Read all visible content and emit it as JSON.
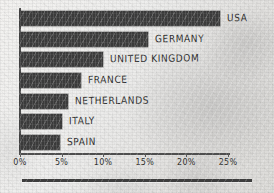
{
  "chart_data": {
    "type": "bar",
    "orientation": "horizontal",
    "title": "",
    "subtitle": "",
    "xlabel": "",
    "ylabel": "",
    "categories": [
      "USA",
      "GERMANY",
      "UNITED KINGDOM",
      "FRANCE",
      "NETHERLANDS",
      "ITALY",
      "SPAIN"
    ],
    "values": [
      24.0,
      15.4,
      10.0,
      7.3,
      5.8,
      5.0,
      4.8
    ],
    "value_unit": "%",
    "xlim": [
      0,
      25
    ],
    "xticks": [
      0,
      5,
      10,
      15,
      20,
      25
    ],
    "xtick_labels": [
      "0%",
      "5%",
      "10%",
      "15%",
      "20%",
      "25%"
    ],
    "grid": false,
    "legend": null,
    "bar_color": "#3a3a3a",
    "axis_color": "#4e4e4e",
    "label_color": "#2e2e2e",
    "background_color": "#e9e8e6",
    "bars": [
      {
        "label": "USA",
        "value": 24.0
      },
      {
        "label": "GERMANY",
        "value": 15.4
      },
      {
        "label": "UNITED KINGDOM",
        "value": 10.0
      },
      {
        "label": "FRANCE",
        "value": 7.3
      },
      {
        "label": "NETHERLANDS",
        "value": 5.8
      },
      {
        "label": "ITALY",
        "value": 5.0
      },
      {
        "label": "SPAIN",
        "value": 4.8
      }
    ]
  }
}
